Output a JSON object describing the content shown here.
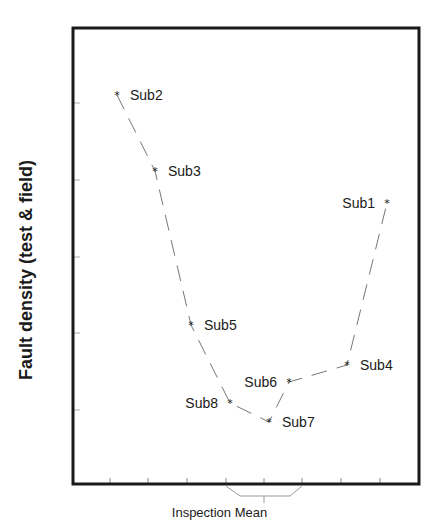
{
  "chart_data": {
    "type": "line",
    "title": "",
    "xlabel": "Inspection Mean",
    "ylabel": "Fault density (test & field)",
    "grid": false,
    "legend": null,
    "x_ticks_count": 8,
    "y_ticks_count": 5,
    "x_ticks_labeled": false,
    "y_ticks_labeled": false,
    "xlim": [
      0,
      9
    ],
    "ylim": [
      0,
      6
    ],
    "line_style": "dashed",
    "marker": "star",
    "points": [
      {
        "label": "Sub2",
        "x": 1.1,
        "y": 5.05
      },
      {
        "label": "Sub3",
        "x": 2.1,
        "y": 4.05
      },
      {
        "label": "Sub5",
        "x": 3.0,
        "y": 2.05
      },
      {
        "label": "Sub8",
        "x": 4.0,
        "y": 1.05
      },
      {
        "label": "Sub7",
        "x": 5.0,
        "y": 0.8
      },
      {
        "label": "Sub6",
        "x": 5.6,
        "y": 1.3
      },
      {
        "label": "Sub4",
        "x": 7.0,
        "y": 1.5
      },
      {
        "label": "Sub1",
        "x": 8.0,
        "y": 3.8
      }
    ],
    "line_order": [
      "Sub2",
      "Sub3",
      "Sub5",
      "Sub8",
      "Sub7",
      "Sub6",
      "Sub4",
      "Sub1"
    ],
    "annotations": [
      {
        "type": "bracket",
        "text": "Inspection Mean",
        "span_ticks": [
          4,
          6
        ]
      }
    ]
  },
  "labels": {
    "ylabel": "Fault density (test & field)",
    "xlabel": "Inspection Mean"
  }
}
